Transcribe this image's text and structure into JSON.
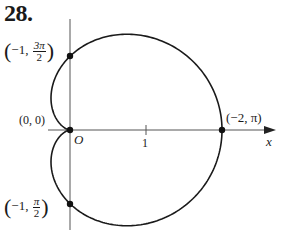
{
  "problem_number": "28.",
  "labels": {
    "top_point": {
      "open": "(",
      "x": "−1,",
      "num": "3π",
      "den": "2",
      "close": ")"
    },
    "bottom_point": {
      "open": "(",
      "x": "−1,",
      "num": "π",
      "den": "2",
      "close": ")"
    },
    "origin_coord": "(0, 0)",
    "origin_name": "O",
    "right_point": "(−2, π)",
    "tick_label": "1",
    "x_axis_label": "x"
  },
  "curve": {
    "type": "cardioid",
    "equation_hint": "r = -1 + cos θ",
    "stroke": "#1a1a1a"
  },
  "axes": {
    "origin_px": [
      70,
      130
    ],
    "unit_px": 76
  }
}
